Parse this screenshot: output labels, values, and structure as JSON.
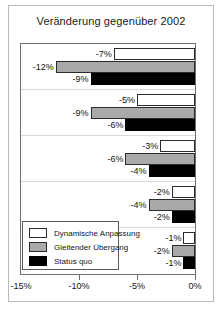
{
  "figure": {
    "title": "Veränderung gegenüber 2002"
  },
  "legend": {
    "items": [
      {
        "label": "Dynamische Anpassung",
        "swatch": "white",
        "color": "#ffffff"
      },
      {
        "label": "Gleitender Übergang",
        "swatch": "gray",
        "color": "#a9a9a9"
      },
      {
        "label": "Status quo",
        "swatch": "black",
        "color": "#000000"
      }
    ]
  },
  "axis": {
    "x_ticks": [
      "-15%",
      "-10%",
      "-5%",
      "0%"
    ]
  },
  "chart_data": {
    "type": "bar",
    "orientation": "horizontal",
    "title": "Veränderung gegenüber 2002",
    "xlabel": "",
    "ylabel": "",
    "xlim": [
      -15,
      0
    ],
    "xticks": [
      -15,
      -10,
      -5,
      0
    ],
    "xtick_labels": [
      "-15%",
      "-10%",
      "-5%",
      "0%"
    ],
    "grid": false,
    "legend_position": "inside-bottom-left",
    "categories": [
      "Gruppe 1",
      "Gruppe 2",
      "Gruppe 3",
      "Gruppe 4",
      "Gruppe 5"
    ],
    "series": [
      {
        "name": "Dynamische Anpassung",
        "color": "#ffffff",
        "values": [
          -7,
          -5,
          -3,
          -2,
          -1
        ],
        "labels": [
          "-7%",
          "-5%",
          "-3%",
          "-2%",
          "-1%"
        ]
      },
      {
        "name": "Gleitender Übergang",
        "color": "#a9a9a9",
        "values": [
          -12,
          -9,
          -6,
          -4,
          -2
        ],
        "labels": [
          "-12%",
          "-9%",
          "-6%",
          "-4%",
          "-2%"
        ]
      },
      {
        "name": "Status quo",
        "color": "#000000",
        "values": [
          -9,
          -6,
          -4,
          -2,
          -1
        ],
        "labels": [
          "-9%",
          "-6%",
          "-4%",
          "-2%",
          "-1%"
        ]
      }
    ]
  }
}
